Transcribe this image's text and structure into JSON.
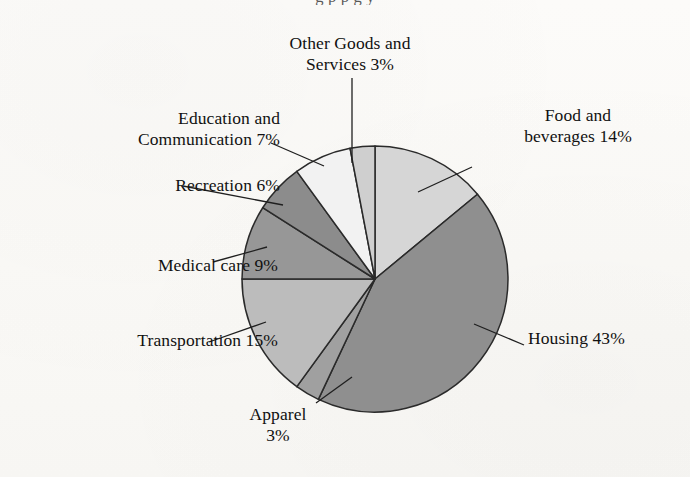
{
  "page": {
    "cropped_top_text": "g                                    p                               p         g   y"
  },
  "chart_data": {
    "type": "pie",
    "title": "",
    "legend_position": "callout-labels",
    "grid": false,
    "start_angle_deg": 0,
    "direction": "clockwise",
    "categories": [
      "Food and beverages",
      "Housing",
      "Apparel",
      "Transportation",
      "Medical care",
      "Recreation",
      "Education and Communication",
      "Other Goods and Services"
    ],
    "values": [
      14,
      43,
      3,
      15,
      9,
      6,
      7,
      3
    ],
    "unit": "%",
    "slice_colors": [
      "#d6d6d6",
      "#8f8f8f",
      "#a0a0a0",
      "#bcbcbc",
      "#979797",
      "#8c8c8c",
      "#f2f2f2",
      "#cfcfcf"
    ],
    "slice_stroke": "#2a2a2a",
    "labels": [
      {
        "key": "other",
        "text": "Other Goods and\nServices 3%",
        "category": "Other Goods and Services",
        "value": 3,
        "align": "center"
      },
      {
        "key": "food",
        "text": "Food and\nbeverages 14%",
        "category": "Food and beverages",
        "value": 14,
        "align": "center"
      },
      {
        "key": "education",
        "text": "Education and\nCommunication 7%",
        "category": "Education and Communication",
        "value": 7,
        "align": "right"
      },
      {
        "key": "recreation",
        "text": "Recreation 6%",
        "category": "Recreation",
        "value": 6,
        "align": "right"
      },
      {
        "key": "medical",
        "text": "Medical care 9%",
        "category": "Medical care",
        "value": 9,
        "align": "right"
      },
      {
        "key": "transport",
        "text": "Transportation 15%",
        "category": "Transportation",
        "value": 15,
        "align": "right"
      },
      {
        "key": "housing",
        "text": "Housing 43%",
        "category": "Housing",
        "value": 43,
        "align": "left"
      },
      {
        "key": "apparel",
        "text": "Apparel\n3%",
        "category": "Apparel",
        "value": 3,
        "align": "center"
      }
    ],
    "geometry": {
      "center_x": 375,
      "center_y": 279,
      "radius": 133
    }
  }
}
